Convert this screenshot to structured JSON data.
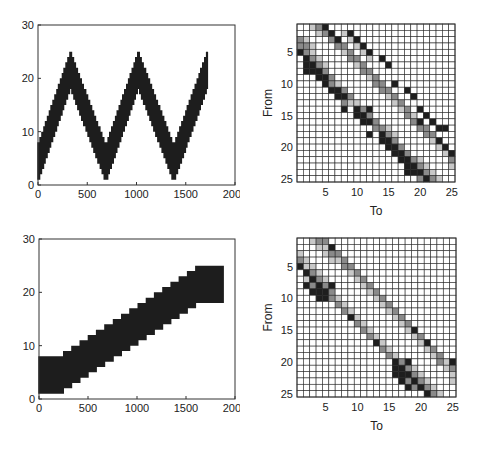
{
  "chart_data": [
    {
      "id": "top-left",
      "type": "line",
      "title": "",
      "xlabel": "",
      "ylabel": "",
      "xlim": [
        0,
        2000
      ],
      "ylim": [
        0,
        30
      ],
      "xticks": [
        0,
        500,
        1000,
        1500,
        2000
      ],
      "yticks": [
        0,
        10,
        20,
        30
      ],
      "grid": false,
      "description": "Dense oscillating trace (state index over time) forming a triangular wave band ~7 units wide, range 1-25",
      "band_center": {
        "x": [
          0,
          330,
          690,
          1020,
          1380,
          1720
        ],
        "y": [
          4,
          21.5,
          4,
          21.5,
          4,
          21.5
        ]
      },
      "band_halfwidth": 3.5,
      "x_end": 1720
    },
    {
      "id": "top-right",
      "type": "heatmap",
      "title": "",
      "xlabel": "To",
      "ylabel": "From",
      "xticks": [
        5,
        10,
        15,
        20,
        25
      ],
      "yticks": [
        5,
        10,
        15,
        20,
        25
      ],
      "size": 25,
      "value_scale": "0=white,1=light gray,2=mid gray,3=black",
      "nonzero": [
        [
          1,
          3,
          1
        ],
        [
          1,
          4,
          2
        ],
        [
          1,
          5,
          3
        ],
        [
          2,
          4,
          1
        ],
        [
          2,
          5,
          2
        ],
        [
          2,
          6,
          3
        ],
        [
          2,
          8,
          1
        ],
        [
          2,
          9,
          3
        ],
        [
          3,
          1,
          2
        ],
        [
          3,
          2,
          1
        ],
        [
          3,
          6,
          2
        ],
        [
          3,
          7,
          3
        ],
        [
          3,
          9,
          1
        ],
        [
          3,
          10,
          3
        ],
        [
          4,
          1,
          2
        ],
        [
          4,
          2,
          2
        ],
        [
          4,
          3,
          1
        ],
        [
          4,
          7,
          2
        ],
        [
          4,
          8,
          2
        ],
        [
          4,
          10,
          1
        ],
        [
          4,
          11,
          3
        ],
        [
          5,
          1,
          3
        ],
        [
          5,
          2,
          2
        ],
        [
          5,
          3,
          1
        ],
        [
          5,
          8,
          1
        ],
        [
          5,
          9,
          2
        ],
        [
          5,
          11,
          1
        ],
        [
          5,
          12,
          3
        ],
        [
          6,
          2,
          3
        ],
        [
          6,
          3,
          2
        ],
        [
          6,
          4,
          1
        ],
        [
          6,
          9,
          2
        ],
        [
          6,
          10,
          2
        ],
        [
          6,
          12,
          1
        ],
        [
          6,
          14,
          3
        ],
        [
          7,
          2,
          3
        ],
        [
          7,
          3,
          3
        ],
        [
          7,
          4,
          2
        ],
        [
          7,
          5,
          1
        ],
        [
          7,
          10,
          1
        ],
        [
          7,
          11,
          2
        ],
        [
          7,
          15,
          3
        ],
        [
          8,
          2,
          3
        ],
        [
          8,
          3,
          3
        ],
        [
          8,
          4,
          3
        ],
        [
          8,
          5,
          2
        ],
        [
          8,
          11,
          2
        ],
        [
          8,
          12,
          2
        ],
        [
          9,
          4,
          3
        ],
        [
          9,
          5,
          3
        ],
        [
          9,
          6,
          2
        ],
        [
          9,
          12,
          1
        ],
        [
          9,
          13,
          2
        ],
        [
          10,
          5,
          3
        ],
        [
          10,
          6,
          2
        ],
        [
          10,
          7,
          1
        ],
        [
          10,
          13,
          2
        ],
        [
          10,
          14,
          2
        ],
        [
          10,
          16,
          3
        ],
        [
          11,
          6,
          3
        ],
        [
          11,
          7,
          3
        ],
        [
          11,
          8,
          2
        ],
        [
          11,
          14,
          2
        ],
        [
          11,
          15,
          2
        ],
        [
          11,
          18,
          3
        ],
        [
          12,
          7,
          3
        ],
        [
          12,
          8,
          3
        ],
        [
          12,
          9,
          2
        ],
        [
          12,
          15,
          1
        ],
        [
          12,
          16,
          2
        ],
        [
          12,
          19,
          3
        ],
        [
          13,
          8,
          2
        ],
        [
          13,
          9,
          1
        ],
        [
          13,
          10,
          1
        ],
        [
          13,
          16,
          1
        ],
        [
          13,
          17,
          2
        ],
        [
          14,
          8,
          3
        ],
        [
          14,
          10,
          3
        ],
        [
          14,
          11,
          2
        ],
        [
          14,
          12,
          3
        ],
        [
          14,
          17,
          1
        ],
        [
          14,
          18,
          2
        ],
        [
          14,
          20,
          3
        ],
        [
          15,
          10,
          3
        ],
        [
          15,
          11,
          3
        ],
        [
          15,
          12,
          2
        ],
        [
          15,
          18,
          2
        ],
        [
          15,
          19,
          1
        ],
        [
          15,
          21,
          3
        ],
        [
          16,
          11,
          3
        ],
        [
          16,
          12,
          3
        ],
        [
          16,
          13,
          2
        ],
        [
          16,
          19,
          2
        ],
        [
          16,
          20,
          3
        ],
        [
          16,
          22,
          3
        ],
        [
          17,
          13,
          2
        ],
        [
          17,
          14,
          2
        ],
        [
          17,
          15,
          1
        ],
        [
          17,
          20,
          2
        ],
        [
          17,
          21,
          2
        ],
        [
          17,
          23,
          3
        ],
        [
          17,
          24,
          3
        ],
        [
          18,
          12,
          3
        ],
        [
          18,
          14,
          3
        ],
        [
          18,
          15,
          2
        ],
        [
          18,
          16,
          1
        ],
        [
          18,
          21,
          2
        ],
        [
          18,
          22,
          2
        ],
        [
          19,
          14,
          3
        ],
        [
          19,
          15,
          3
        ],
        [
          19,
          16,
          2
        ],
        [
          19,
          22,
          1
        ],
        [
          19,
          23,
          3
        ],
        [
          20,
          15,
          3
        ],
        [
          20,
          16,
          3
        ],
        [
          20,
          17,
          2
        ],
        [
          20,
          23,
          1
        ],
        [
          20,
          24,
          3
        ],
        [
          21,
          16,
          3
        ],
        [
          21,
          17,
          3
        ],
        [
          21,
          18,
          2
        ],
        [
          21,
          24,
          1
        ],
        [
          21,
          25,
          3
        ],
        [
          22,
          17,
          3
        ],
        [
          22,
          18,
          3
        ],
        [
          22,
          19,
          2
        ],
        [
          22,
          20,
          1
        ],
        [
          22,
          25,
          2
        ],
        [
          23,
          18,
          3
        ],
        [
          23,
          19,
          3
        ],
        [
          23,
          20,
          2
        ],
        [
          23,
          21,
          1
        ],
        [
          23,
          25,
          1
        ],
        [
          24,
          18,
          3
        ],
        [
          24,
          19,
          3
        ],
        [
          24,
          20,
          3
        ],
        [
          24,
          21,
          2
        ],
        [
          24,
          22,
          1
        ],
        [
          25,
          20,
          2
        ],
        [
          25,
          21,
          3
        ],
        [
          25,
          22,
          2
        ],
        [
          25,
          23,
          1
        ]
      ]
    },
    {
      "id": "bottom-left",
      "type": "line",
      "title": "",
      "xlabel": "",
      "ylabel": "",
      "xlim": [
        0,
        2000
      ],
      "ylim": [
        0,
        30
      ],
      "xticks": [
        0,
        500,
        1000,
        1500,
        2000
      ],
      "yticks": [
        0,
        10,
        20,
        30
      ],
      "grid": false,
      "description": "Dense oscillating trace forming a rising staircase band ~7 units wide, from ~1-8 at start to ~18-25 at end",
      "band_center": {
        "x": [
          0,
          250,
          1600,
          1880
        ],
        "y": [
          4.5,
          5,
          21,
          21.5
        ]
      },
      "band_halfwidth": 3.5,
      "x_end": 1880
    },
    {
      "id": "bottom-right",
      "type": "heatmap",
      "title": "",
      "xlabel": "To",
      "ylabel": "From",
      "xticks": [
        5,
        10,
        15,
        20,
        25
      ],
      "yticks": [
        5,
        10,
        15,
        20,
        25
      ],
      "size": 25,
      "value_scale": "0=white,1=light gray,2=mid gray,3=black",
      "nonzero": [
        [
          1,
          3,
          1
        ],
        [
          1,
          4,
          2
        ],
        [
          1,
          5,
          2
        ],
        [
          2,
          4,
          1
        ],
        [
          2,
          5,
          1
        ],
        [
          2,
          6,
          3
        ],
        [
          3,
          1,
          1
        ],
        [
          3,
          5,
          1
        ],
        [
          3,
          6,
          2
        ],
        [
          3,
          7,
          2
        ],
        [
          4,
          1,
          2
        ],
        [
          4,
          2,
          1
        ],
        [
          4,
          6,
          1
        ],
        [
          4,
          7,
          1
        ],
        [
          4,
          8,
          2
        ],
        [
          5,
          1,
          3
        ],
        [
          5,
          2,
          1
        ],
        [
          5,
          3,
          1
        ],
        [
          5,
          8,
          2
        ],
        [
          5,
          9,
          2
        ],
        [
          6,
          2,
          3
        ],
        [
          6,
          3,
          2
        ],
        [
          6,
          4,
          1
        ],
        [
          6,
          9,
          1
        ],
        [
          6,
          10,
          2
        ],
        [
          7,
          2,
          1
        ],
        [
          7,
          3,
          3
        ],
        [
          7,
          4,
          2
        ],
        [
          7,
          5,
          1
        ],
        [
          7,
          10,
          1
        ],
        [
          7,
          11,
          2
        ],
        [
          8,
          2,
          3
        ],
        [
          8,
          3,
          2
        ],
        [
          8,
          4,
          3
        ],
        [
          8,
          5,
          2
        ],
        [
          8,
          6,
          3
        ],
        [
          8,
          11,
          1
        ],
        [
          8,
          12,
          2
        ],
        [
          9,
          3,
          3
        ],
        [
          9,
          4,
          3
        ],
        [
          9,
          5,
          3
        ],
        [
          9,
          6,
          2
        ],
        [
          9,
          12,
          1
        ],
        [
          9,
          13,
          2
        ],
        [
          10,
          4,
          3
        ],
        [
          10,
          5,
          3
        ],
        [
          10,
          6,
          2
        ],
        [
          10,
          7,
          1
        ],
        [
          10,
          13,
          1
        ],
        [
          10,
          14,
          2
        ],
        [
          11,
          7,
          2
        ],
        [
          11,
          8,
          1
        ],
        [
          11,
          14,
          1
        ],
        [
          11,
          15,
          2
        ],
        [
          12,
          8,
          2
        ],
        [
          12,
          9,
          1
        ],
        [
          12,
          15,
          1
        ],
        [
          12,
          16,
          2
        ],
        [
          13,
          9,
          3
        ],
        [
          13,
          10,
          1
        ],
        [
          13,
          16,
          1
        ],
        [
          13,
          17,
          2
        ],
        [
          14,
          10,
          2
        ],
        [
          14,
          11,
          1
        ],
        [
          14,
          17,
          1
        ],
        [
          14,
          18,
          2
        ],
        [
          15,
          11,
          2
        ],
        [
          15,
          12,
          1
        ],
        [
          15,
          18,
          1
        ],
        [
          15,
          19,
          3
        ],
        [
          16,
          12,
          2
        ],
        [
          16,
          13,
          1
        ],
        [
          16,
          19,
          1
        ],
        [
          16,
          20,
          2
        ],
        [
          17,
          13,
          3
        ],
        [
          17,
          14,
          1
        ],
        [
          17,
          20,
          1
        ],
        [
          17,
          21,
          3
        ],
        [
          18,
          14,
          2
        ],
        [
          18,
          15,
          1
        ],
        [
          18,
          21,
          1
        ],
        [
          18,
          22,
          2
        ],
        [
          19,
          15,
          2
        ],
        [
          19,
          16,
          1
        ],
        [
          19,
          22,
          1
        ],
        [
          19,
          23,
          2
        ],
        [
          20,
          16,
          3
        ],
        [
          20,
          17,
          2
        ],
        [
          20,
          18,
          3
        ],
        [
          20,
          23,
          2
        ],
        [
          20,
          24,
          1
        ],
        [
          20,
          25,
          3
        ],
        [
          21,
          16,
          3
        ],
        [
          21,
          17,
          3
        ],
        [
          21,
          18,
          2
        ],
        [
          21,
          19,
          1
        ],
        [
          21,
          24,
          1
        ],
        [
          21,
          25,
          2
        ],
        [
          22,
          16,
          3
        ],
        [
          22,
          17,
          3
        ],
        [
          22,
          18,
          3
        ],
        [
          22,
          19,
          2
        ],
        [
          22,
          20,
          1
        ],
        [
          22,
          25,
          1
        ],
        [
          23,
          17,
          3
        ],
        [
          23,
          18,
          2
        ],
        [
          23,
          19,
          3
        ],
        [
          23,
          20,
          2
        ],
        [
          23,
          21,
          1
        ],
        [
          23,
          25,
          1
        ],
        [
          24,
          18,
          3
        ],
        [
          24,
          19,
          2
        ],
        [
          24,
          20,
          3
        ],
        [
          24,
          21,
          2
        ],
        [
          24,
          22,
          1
        ],
        [
          25,
          21,
          3
        ],
        [
          25,
          22,
          2
        ],
        [
          25,
          23,
          1
        ]
      ]
    }
  ],
  "colors": {
    "level0": "#ffffff",
    "level1": "#c8c8c8",
    "level2": "#8a8a8a",
    "level3": "#1e1e1e",
    "trace": "#0a0a0a",
    "axis": "#333333"
  }
}
